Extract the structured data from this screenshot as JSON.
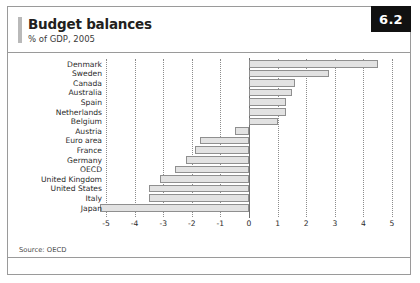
{
  "figure": {
    "badge": "6.2",
    "title": "Budget balances",
    "subtitle": "% of GDP, 2005",
    "source": "Source: OECD"
  },
  "style": {
    "bar_fill": "#e2e2e2",
    "bar_stroke": "#8f8f8f",
    "grid_color": "#8c8c8c",
    "axis_color": "#6f6f6f",
    "badge_bg": "#111111",
    "badge_text": "#ffffff",
    "frame_color": "#9a9a9a",
    "accent": "#b9b9b9"
  },
  "chart_data": {
    "type": "bar",
    "orientation": "horizontal",
    "title": "Budget balances",
    "subtitle": "% of GDP, 2005",
    "xlabel": "",
    "ylabel": "",
    "xlim": [
      -5,
      5
    ],
    "xticks": [
      -5,
      -4,
      -3,
      -2,
      -1,
      0,
      1,
      2,
      3,
      4,
      5
    ],
    "xtick_labels": [
      "-5",
      "-4",
      "-3",
      "-2",
      "-1",
      "0",
      "1",
      "2",
      "3",
      "4",
      "5"
    ],
    "grid": true,
    "grid_style": "dotted-vertical",
    "legend": false,
    "source": "Source: OECD",
    "categories": [
      "Denmark",
      "Sweden",
      "Canada",
      "Australia",
      "Spain",
      "Netherlands",
      "Belgium",
      "Austria",
      "Euro area",
      "France",
      "Germany",
      "OECD",
      "United Kingdom",
      "United States",
      "Italy",
      "Japan"
    ],
    "values": [
      4.5,
      2.8,
      1.6,
      1.5,
      1.3,
      1.3,
      1.0,
      -0.5,
      -1.7,
      -1.9,
      -2.2,
      -2.6,
      -3.1,
      -3.5,
      -3.5,
      -5.2
    ]
  }
}
